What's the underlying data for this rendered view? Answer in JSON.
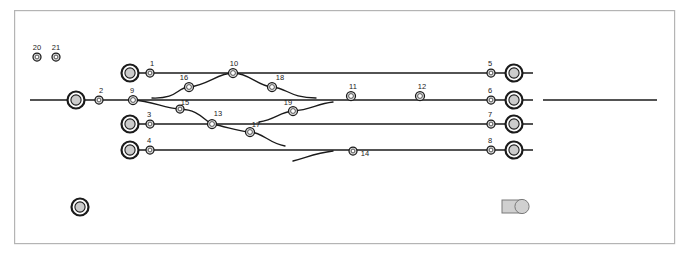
{
  "diagram": {
    "canvas": {
      "width": 689,
      "height": 255,
      "background": "#ffffff"
    },
    "frame": {
      "x": 14,
      "y": 10,
      "width": 660,
      "height": 233,
      "stroke": "#b4b4b4"
    },
    "colors": {
      "line": "#1a1a1a",
      "label": "#1a1a1a",
      "node_fill": "#d9d9d9",
      "terminal_fill": "#cccccc",
      "frame": "#b4b4b4"
    },
    "tracks": [
      {
        "name": "track-1",
        "y": 73,
        "x1": 128,
        "x2": 533
      },
      {
        "name": "track-2",
        "y": 100,
        "x1": 30,
        "x2": 533
      },
      {
        "name": "track-2-right-stub",
        "y": 100,
        "x1": 543,
        "x2": 657
      },
      {
        "name": "track-3",
        "y": 124,
        "x1": 128,
        "x2": 533
      },
      {
        "name": "track-4",
        "y": 150,
        "x1": 128,
        "x2": 533
      }
    ],
    "terminals": [
      {
        "name": "terminal-left-main",
        "cx": 76,
        "cy": 100,
        "r": 8.5
      },
      {
        "name": "terminal-left-t1",
        "cx": 130,
        "cy": 73,
        "r": 8.5
      },
      {
        "name": "terminal-left-t3",
        "cx": 130,
        "cy": 124,
        "r": 8.5
      },
      {
        "name": "terminal-left-t4",
        "cx": 130,
        "cy": 150,
        "r": 8.5
      },
      {
        "name": "terminal-right-t1",
        "cx": 514,
        "cy": 73,
        "r": 8.5
      },
      {
        "name": "terminal-right-t2",
        "cx": 514,
        "cy": 100,
        "r": 8.5
      },
      {
        "name": "terminal-right-t3",
        "cx": 514,
        "cy": 124,
        "r": 8.5
      },
      {
        "name": "terminal-right-t4",
        "cx": 514,
        "cy": 150,
        "r": 8.5
      }
    ],
    "nodes": [
      {
        "id": "1",
        "cx": 150,
        "cy": 73,
        "r": 4.0,
        "label": "1",
        "lx": 152,
        "ly": 66
      },
      {
        "id": "2",
        "cx": 99,
        "cy": 100,
        "r": 4.0,
        "label": "2",
        "lx": 101,
        "ly": 93
      },
      {
        "id": "3",
        "cx": 150,
        "cy": 124,
        "r": 4.0,
        "label": "3",
        "lx": 149,
        "ly": 117
      },
      {
        "id": "4",
        "cx": 150,
        "cy": 150,
        "r": 4.0,
        "label": "4",
        "lx": 149,
        "ly": 143
      },
      {
        "id": "5",
        "cx": 491,
        "cy": 73,
        "r": 4.0,
        "label": "5",
        "lx": 490,
        "ly": 66
      },
      {
        "id": "6",
        "cx": 491,
        "cy": 100,
        "r": 4.0,
        "label": "6",
        "lx": 490,
        "ly": 93
      },
      {
        "id": "7",
        "cx": 491,
        "cy": 124,
        "r": 4.0,
        "label": "7",
        "lx": 490,
        "ly": 117
      },
      {
        "id": "8",
        "cx": 491,
        "cy": 150,
        "r": 4.0,
        "label": "8",
        "lx": 490,
        "ly": 143
      },
      {
        "id": "9",
        "cx": 133,
        "cy": 100,
        "r": 4.5,
        "label": "9",
        "lx": 132,
        "ly": 93
      },
      {
        "id": "10",
        "cx": 233,
        "cy": 73,
        "r": 4.5,
        "label": "10",
        "lx": 234,
        "ly": 66
      },
      {
        "id": "11",
        "cx": 351,
        "cy": 96,
        "r": 4.5,
        "label": "11",
        "lx": 353,
        "ly": 89
      },
      {
        "id": "12",
        "cx": 420,
        "cy": 96,
        "r": 4.5,
        "label": "12",
        "lx": 422,
        "ly": 89
      },
      {
        "id": "13",
        "cx": 212,
        "cy": 124,
        "r": 4.5,
        "label": "13",
        "lx": 218,
        "ly": 116
      },
      {
        "id": "14",
        "cx": 353,
        "cy": 151,
        "r": 4.0,
        "label": "14",
        "lx": 365,
        "ly": 156
      },
      {
        "id": "15",
        "cx": 180,
        "cy": 109,
        "r": 4.0,
        "label": "15",
        "lx": 185,
        "ly": 105
      },
      {
        "id": "16",
        "cx": 189,
        "cy": 87,
        "r": 4.5,
        "label": "16",
        "lx": 184,
        "ly": 80
      },
      {
        "id": "17",
        "cx": 250,
        "cy": 132,
        "r": 4.5,
        "label": "17",
        "lx": 256,
        "ly": 127
      },
      {
        "id": "18",
        "cx": 272,
        "cy": 87,
        "r": 4.5,
        "label": "18",
        "lx": 280,
        "ly": 80
      },
      {
        "id": "19",
        "cx": 293,
        "cy": 111,
        "r": 4.5,
        "label": "19",
        "lx": 288,
        "ly": 105
      },
      {
        "id": "20",
        "cx": 37,
        "cy": 57,
        "r": 4.0,
        "label": "20",
        "lx": 37,
        "ly": 50
      },
      {
        "id": "21",
        "cx": 56,
        "cy": 57,
        "r": 4.0,
        "label": "21",
        "lx": 56,
        "ly": 50
      }
    ],
    "curves": [
      {
        "name": "curve-crossover-upper",
        "path": "M 152 98 C 178 99 176 88 189 87 C 208 85 218 73 233 73 C 249 73 258 86 272 87 C 287 88 290 98 316 98"
      },
      {
        "name": "curve-lower-left-branch",
        "path": "M 133 100 C 152 101 164 108 180 109 C 200 110 203 120 212 124"
      },
      {
        "name": "curve-13-to-17",
        "path": "M 212 124 C 228 127 236 131 250 132 C 264 133 268 143 285 146"
      },
      {
        "name": "curve-19-right",
        "path": "M 259 122 C 276 119 280 112 293 111 C 311 110 316 104 333 102"
      },
      {
        "name": "curve-bottom-dangle",
        "path": "M 293 161 C 308 157 316 153 333 151"
      }
    ],
    "legend": [
      {
        "name": "legend-station-symbol",
        "type": "double-ring",
        "cx": 80,
        "cy": 207,
        "r": 8.5
      },
      {
        "name": "legend-tag-symbol",
        "type": "tag",
        "x": 502,
        "y": 200,
        "width": 26,
        "height": 13
      }
    ]
  }
}
